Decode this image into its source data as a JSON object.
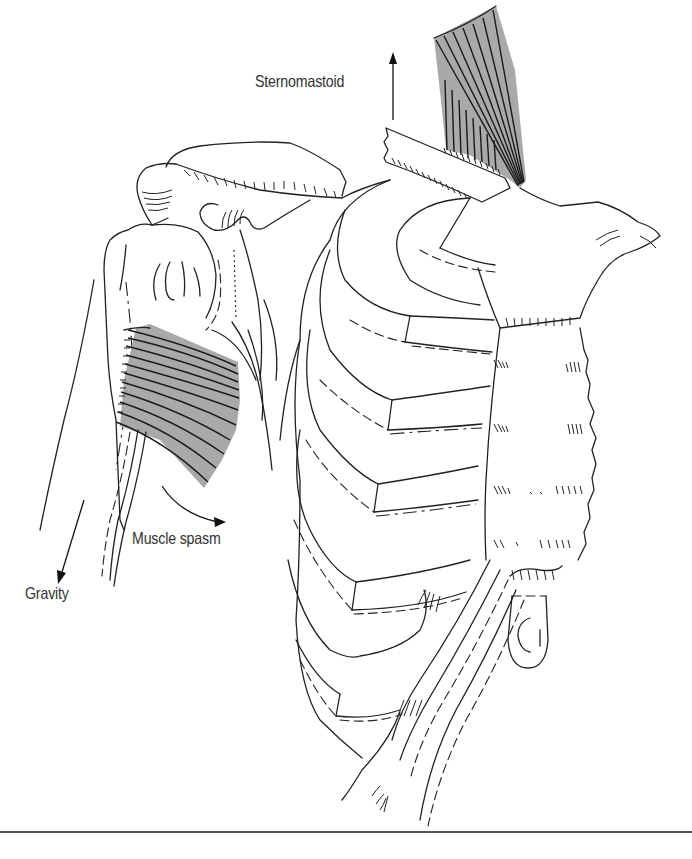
{
  "figure": {
    "type": "anatomical-illustration",
    "labels": {
      "sternomastoid": "Sternomastoid",
      "muscle_spasm": "Muscle spasm",
      "gravity": "Gravity"
    },
    "arrows": [
      {
        "label": "Sternomastoid",
        "direction": "up"
      },
      {
        "label": "Muscle spasm",
        "direction": "curved-down-right"
      },
      {
        "label": "Gravity",
        "direction": "down-left"
      }
    ],
    "colors": {
      "line": "#222222",
      "muscle_fill": "#a9a9a9",
      "label_text": "#333333",
      "rule": "#555555",
      "background": "#ffffff"
    }
  }
}
